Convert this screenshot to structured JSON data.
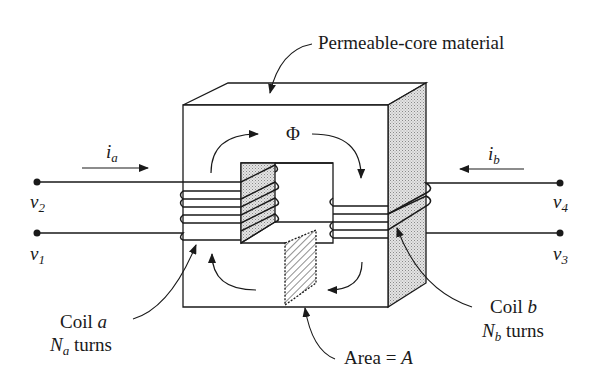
{
  "diagram": {
    "type": "magnetic-core transformer schematic",
    "colors": {
      "ink": "#1a1a1a",
      "background": "#ffffff",
      "side_shade": "#cfcfcf",
      "hatch": "#333333"
    },
    "labels": {
      "core_material": "Permeable-core material",
      "flux": "Φ",
      "current_a": {
        "main": "i",
        "sub": "a"
      },
      "current_b": {
        "main": "i",
        "sub": "b"
      },
      "v1": {
        "main": "v",
        "sub": "1"
      },
      "v2": {
        "main": "v",
        "sub": "2"
      },
      "v3": {
        "main": "v",
        "sub": "3"
      },
      "v4": {
        "main": "v",
        "sub": "4"
      },
      "coil_a_line1_text": "Coil ",
      "coil_a_line1_var": "a",
      "coil_a_line2_main": "N",
      "coil_a_line2_sub": "a",
      "coil_a_line2_text": " turns",
      "coil_b_line1_text": "Coil ",
      "coil_b_line1_var": "b",
      "coil_b_line2_main": "N",
      "coil_b_line2_sub": "b",
      "coil_b_line2_text": " turns",
      "area_text": "Area = ",
      "area_var": "A"
    },
    "components": {
      "coil_a_turns_drawn": 4,
      "coil_b_turns_drawn": 3,
      "terminals": [
        "v1",
        "v2",
        "v3",
        "v4"
      ]
    }
  }
}
